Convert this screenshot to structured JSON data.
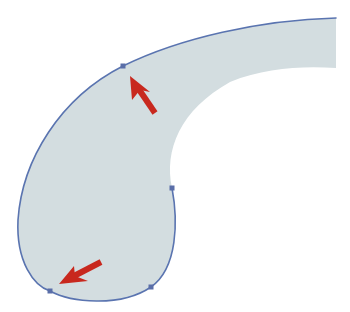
{
  "figure": {
    "description": "Curved comma/teardrop vector path with anchor points and direction arrows",
    "width": 350,
    "height": 312,
    "colors": {
      "background": "#ffffff",
      "fill": "#d3dde0",
      "stroke": "#5a74b0",
      "anchor": "#5a6ea8",
      "arrow": "#c8281e"
    },
    "anchor_points": [
      {
        "id": "top-anchor",
        "x": 123,
        "y": 66
      },
      {
        "id": "inner-anchor",
        "x": 172,
        "y": 188
      },
      {
        "id": "bottom-right-anchor",
        "x": 151,
        "y": 287
      },
      {
        "id": "bottom-left-anchor",
        "x": 50,
        "y": 291
      }
    ],
    "arrows": [
      {
        "id": "arrow-top",
        "tail": [
          155,
          113
        ],
        "tip": [
          130,
          76
        ]
      },
      {
        "id": "arrow-bottom",
        "tail": [
          101,
          262
        ],
        "tip": [
          59,
          284
        ]
      }
    ]
  }
}
